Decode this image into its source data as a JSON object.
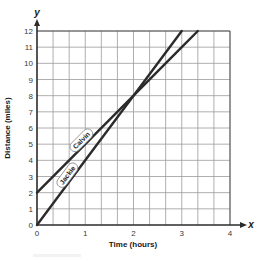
{
  "chart_data": {
    "type": "line",
    "title": "",
    "xlabel": "Time (hours)",
    "ylabel": "Distance (miles)",
    "x_axis_variable": "x",
    "y_axis_variable": "y",
    "xlim": [
      0,
      4
    ],
    "ylim": [
      0,
      12
    ],
    "x_ticks": [
      0,
      1,
      2,
      3,
      4
    ],
    "y_ticks": [
      0,
      1,
      2,
      3,
      4,
      5,
      6,
      7,
      8,
      9,
      10,
      11,
      12
    ],
    "x_minor_grid_step": 0.3333,
    "y_grid_step": 1,
    "grid": true,
    "legend": "inline labels on lines",
    "series": [
      {
        "name": "Calvin",
        "equation": "y = 3x + 2",
        "x": [
          0,
          1,
          2,
          3,
          3.333
        ],
        "y": [
          2,
          5,
          8,
          11,
          12
        ],
        "color": "#2b2b2b"
      },
      {
        "name": "Jackie",
        "equation": "y = 4x",
        "x": [
          0,
          1,
          2,
          3
        ],
        "y": [
          0,
          4,
          8,
          12
        ],
        "color": "#2b2b2b"
      }
    ],
    "annotations": [
      {
        "type": "intersection",
        "x": 2,
        "y": 8
      }
    ]
  },
  "labels": {
    "xlabel": "Time (hours)",
    "ylabel": "Distance (miles)",
    "x_var": "x",
    "y_var": "y",
    "calvin": "Calvin",
    "jackie": "Jackie",
    "x_ticks": [
      "0",
      "1",
      "2",
      "3",
      "4"
    ],
    "y_ticks": [
      "0",
      "1",
      "2",
      "3",
      "4",
      "5",
      "6",
      "7",
      "8",
      "9",
      "10",
      "11",
      "12"
    ]
  },
  "style": {
    "line_color": "#2b2b2b",
    "axis_color": "#2b2b2b",
    "grid_color": "#9a9a9a",
    "background": "#ffffff"
  }
}
